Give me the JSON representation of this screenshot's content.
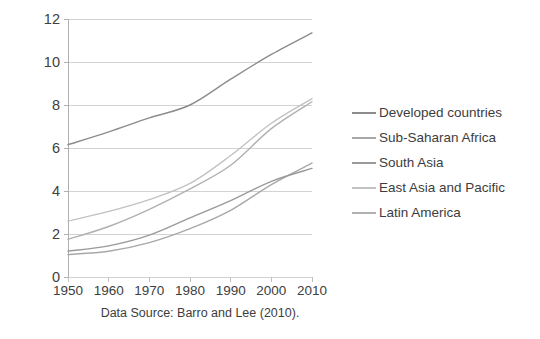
{
  "chart_data": {
    "type": "line",
    "title": "",
    "subtitle": "",
    "xlabel": "",
    "ylabel": "",
    "caption": "Data Source: Barro and Lee (2010).",
    "x": [
      1950,
      1960,
      1970,
      1980,
      1990,
      2000,
      2010
    ],
    "xtick_labels": [
      "1950",
      "1960",
      "1970",
      "1980",
      "1990",
      "2000",
      "2010"
    ],
    "ytick_labels": [
      "0",
      "2",
      "4",
      "6",
      "8",
      "10",
      "12"
    ],
    "ytick_values": [
      0,
      2,
      4,
      6,
      8,
      10,
      12
    ],
    "xlim": [
      1950,
      2010
    ],
    "ylim": [
      0,
      12
    ],
    "grid": "horizontal",
    "legend_position": "right",
    "series": [
      {
        "name": "Developed countries",
        "color": "#8c8c8c",
        "values": [
          6.15,
          6.75,
          7.4,
          8.0,
          9.2,
          10.35,
          11.35
        ]
      },
      {
        "name": "Sub-Saharan Africa",
        "color": "#a8a8a8",
        "values": [
          1.05,
          1.2,
          1.6,
          2.25,
          3.1,
          4.3,
          5.3
        ]
      },
      {
        "name": "South Asia",
        "color": "#9a9a9a",
        "values": [
          1.2,
          1.45,
          1.95,
          2.75,
          3.55,
          4.45,
          5.05
        ]
      },
      {
        "name": "East Asia and Pacific",
        "color": "#c2c2c2",
        "values": [
          2.6,
          3.05,
          3.6,
          4.35,
          5.65,
          7.15,
          8.3
        ]
      },
      {
        "name": "Latin America",
        "color": "#b0b0b0",
        "values": [
          1.75,
          2.35,
          3.15,
          4.1,
          5.2,
          6.9,
          8.15
        ]
      }
    ]
  },
  "legend": {
    "items": [
      {
        "label": "Developed countries"
      },
      {
        "label": "Sub-Saharan Africa"
      },
      {
        "label": "South Asia"
      },
      {
        "label": "East Asia and Pacific"
      },
      {
        "label": "Latin America"
      }
    ]
  }
}
